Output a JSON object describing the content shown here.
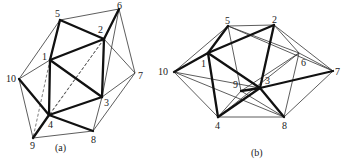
{
  "figures": [
    {
      "id": "a",
      "caption": "(a)",
      "vertices": [
        {
          "label": "1",
          "x": 50,
          "y": 60
        },
        {
          "label": "2",
          "x": 104,
          "y": 39
        },
        {
          "label": "3",
          "x": 102,
          "y": 97
        },
        {
          "label": "4",
          "x": 49,
          "y": 115
        },
        {
          "label": "5",
          "x": 60,
          "y": 20
        },
        {
          "label": "6",
          "x": 119,
          "y": 9
        },
        {
          "label": "7",
          "x": 135,
          "y": 73
        },
        {
          "label": "8",
          "x": 93,
          "y": 131
        },
        {
          "label": "9",
          "x": 33,
          "y": 138
        },
        {
          "label": "10",
          "x": 19,
          "y": 79
        }
      ],
      "labels": {
        "1": "1",
        "2": "2",
        "3": "3",
        "4": "4",
        "5": "5",
        "6": "6",
        "7": "7",
        "8": "8",
        "9": "9",
        "10": "10"
      }
    },
    {
      "id": "b",
      "caption": "(b)",
      "vertices": [
        {
          "label": "1",
          "x": 208,
          "y": 53
        },
        {
          "label": "2",
          "x": 274,
          "y": 25
        },
        {
          "label": "3",
          "x": 260,
          "y": 88
        },
        {
          "label": "4",
          "x": 218,
          "y": 117
        },
        {
          "label": "5",
          "x": 228,
          "y": 26
        },
        {
          "label": "6",
          "x": 299,
          "y": 53
        },
        {
          "label": "7",
          "x": 333,
          "y": 71
        },
        {
          "label": "8",
          "x": 284,
          "y": 117
        },
        {
          "label": "9",
          "x": 241,
          "y": 91
        },
        {
          "label": "10",
          "x": 174,
          "y": 72
        }
      ],
      "labels": {
        "1": "1",
        "2": "2",
        "3": "3",
        "4": "4",
        "5": "5",
        "6": "6",
        "7": "7",
        "8": "8",
        "9": "9",
        "10": "10"
      }
    }
  ]
}
